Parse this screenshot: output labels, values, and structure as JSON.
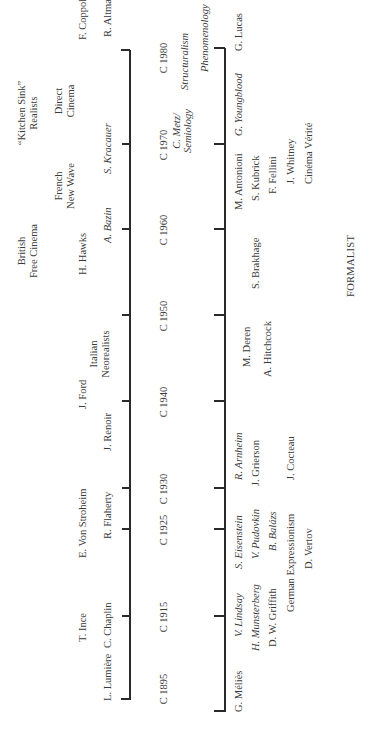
{
  "diagram": {
    "type": "timeline",
    "orientation": "rotated-90-ccw",
    "bottom_label": "FORMALIST",
    "years": [
      "C 1895",
      "C 1915",
      "C 1925",
      "C 1930",
      "C 1940",
      "C 1950",
      "C 1960",
      "C 1970",
      "C 1980"
    ],
    "realist": {
      "row1": [
        {
          "text": "T. Ince",
          "italic": false
        },
        {
          "text": "E. Von Stroheim",
          "italic": false
        },
        {
          "text": "J. Ford",
          "italic": false
        },
        {
          "text": "H. Hawks",
          "italic": false
        },
        {
          "text": "F. Coppola",
          "italic": false
        }
      ],
      "row2": [
        {
          "text": "L. Lumière",
          "italic": false
        },
        {
          "text": "C. Chaplin",
          "italic": false
        },
        {
          "text": "R. Flaherty",
          "italic": false
        },
        {
          "text": "J. Renoir",
          "italic": false
        },
        {
          "text": "A. Bazin",
          "italic": true
        },
        {
          "text": "S. Kracauer",
          "italic": true
        },
        {
          "text": "R. Altman",
          "italic": false
        }
      ],
      "movements": [
        {
          "line1": "Italian",
          "line2": "Neorealists"
        },
        {
          "line1": "British",
          "line2": "Free Cinema"
        },
        {
          "line1": "French",
          "line2": "New Wave"
        },
        {
          "line1": "“Kitchen Sink”",
          "line2": "Realists"
        },
        {
          "line1": "Direct",
          "line2": "Cinema"
        }
      ]
    },
    "axis_annotations": [
      {
        "line1": "C. Metz/",
        "line2": "Semiology",
        "italic": true
      },
      {
        "text": "Structuralism",
        "italic": true
      },
      {
        "text": "Phenomenology",
        "italic": true
      }
    ],
    "formalist": {
      "items": [
        {
          "text": "G. Méliès",
          "italic": false
        },
        {
          "text": "V. Lindsay",
          "italic": true
        },
        {
          "text": "H. Munsterberg",
          "italic": true
        },
        {
          "text": "D. W. Griffith",
          "italic": false
        },
        {
          "text": "German Expressionism",
          "italic": false
        },
        {
          "text": "S. Eisenstein",
          "italic": true
        },
        {
          "text": "V. Pudovkin",
          "italic": true
        },
        {
          "text": "B. Balázs",
          "italic": true
        },
        {
          "text": "D. Vertov",
          "italic": false
        },
        {
          "text": "R. Arnheim",
          "italic": true
        },
        {
          "text": "J. Grierson",
          "italic": false
        },
        {
          "text": "J. Cocteau",
          "italic": false
        },
        {
          "text": "M. Deren",
          "italic": false
        },
        {
          "text": "A. Hitchcock",
          "italic": false
        },
        {
          "text": "S. Brakhage",
          "italic": false
        },
        {
          "text": "M. Antonioni",
          "italic": false
        },
        {
          "text": "S. Kubrick",
          "italic": false
        },
        {
          "text": "F. Fellini",
          "italic": false
        },
        {
          "text": "J. Whitney",
          "italic": false
        },
        {
          "text": "Cinéma Vérité",
          "italic": false
        },
        {
          "text": "G. Youngblood",
          "italic": true
        },
        {
          "text": "G. Lucas",
          "italic": false
        }
      ]
    }
  }
}
